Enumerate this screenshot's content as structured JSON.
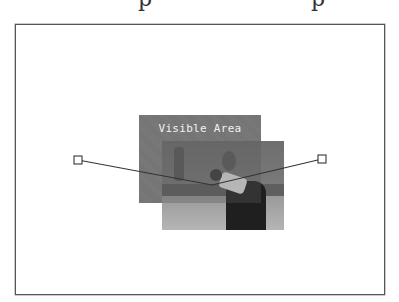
{
  "figure": {
    "caption_fragment": "p p",
    "visible_area_label": "Visible Area",
    "colors": {
      "frame_border": "#555555",
      "visible_area_fill": "#7a7a7a",
      "label_text": "#f2f2f2",
      "line": "#333333",
      "handle_fill": "#ffffff"
    },
    "handles": [
      {
        "name": "left",
        "x": 78,
        "y": 160
      },
      {
        "name": "right",
        "x": 322,
        "y": 159
      }
    ],
    "vertex": {
      "x": 212,
      "y": 185
    }
  }
}
